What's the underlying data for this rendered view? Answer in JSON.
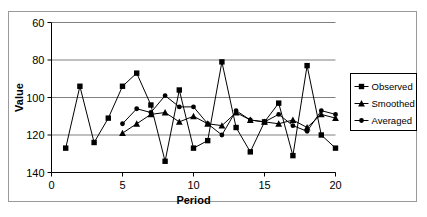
{
  "chart_data": {
    "type": "line",
    "title": "",
    "xlabel": "Period",
    "ylabel": "Value",
    "xlim": [
      0,
      20
    ],
    "ylim": [
      60,
      140
    ],
    "xticks": [
      0,
      5,
      10,
      15,
      20
    ],
    "yticks": [
      60,
      80,
      100,
      120,
      140
    ],
    "grid": true,
    "legend_position": "right",
    "x": [
      1,
      2,
      3,
      4,
      5,
      6,
      7,
      8,
      9,
      10,
      11,
      12,
      13,
      14,
      15,
      16,
      17,
      18,
      19,
      20
    ],
    "series": [
      {
        "name": "Observed",
        "marker": "square",
        "color": "#000000",
        "x": [
          1,
          2,
          3,
          4,
          5,
          6,
          7,
          8,
          9,
          10,
          11,
          12,
          13,
          14,
          15,
          16,
          17,
          18,
          19,
          20
        ],
        "values": [
          73,
          106,
          76,
          89,
          106,
          113,
          96,
          66,
          104,
          73,
          77,
          119,
          84,
          71,
          87,
          97,
          69,
          117,
          80,
          73
        ]
      },
      {
        "name": "Smoothed",
        "marker": "triangle",
        "color": "#000000",
        "x": [
          5,
          6,
          7,
          8,
          9,
          10,
          11,
          12,
          13,
          14,
          15,
          16,
          17,
          18,
          19,
          20
        ],
        "values": [
          81,
          86,
          91,
          92,
          87,
          90,
          86,
          85,
          92,
          88,
          87,
          86,
          88,
          84,
          91,
          89
        ]
      },
      {
        "name": "Averaged",
        "marker": "circle",
        "color": "#000000",
        "x": [
          5,
          6,
          7,
          8,
          9,
          10,
          11,
          12,
          13,
          14,
          15,
          16,
          17,
          18,
          19,
          20
        ],
        "values": [
          86,
          94,
          92,
          101,
          95,
          95,
          86,
          80,
          93,
          88,
          87,
          91,
          85,
          82,
          93,
          91
        ]
      }
    ]
  },
  "legend": {
    "entries": [
      {
        "label": "Observed"
      },
      {
        "label": "Smoothed"
      },
      {
        "label": "Averaged"
      }
    ]
  },
  "axes": {
    "y_title": "Value",
    "x_title": "Period",
    "y_tick_labels": [
      "140",
      "120",
      "100",
      "80",
      "60"
    ],
    "x_tick_labels": [
      "0",
      "5",
      "10",
      "15",
      "20"
    ]
  },
  "colors": {
    "line": "#000000",
    "grid": "#808080",
    "axis": "#000000",
    "frame": "#9a9a9a",
    "background": "#ffffff"
  }
}
